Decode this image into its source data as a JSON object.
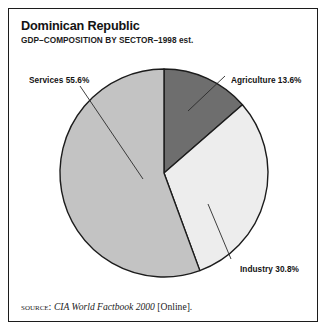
{
  "figure": {
    "title": "Dominican Republic",
    "subtitle": "GDP–COMPOSITION BY SECTOR–1998 est.",
    "source": {
      "label": "SOURCE:",
      "work": "CIA World Factbook 2000",
      "suffix": "[Online]."
    }
  },
  "labels": {
    "services": "Services 55.6%",
    "agriculture": "Agriculture 13.6%",
    "industry": "Industry 30.8%"
  },
  "chart_data": {
    "type": "pie",
    "title": "Dominican Republic",
    "subtitle": "GDP–COMPOSITION BY SECTOR–1998 est.",
    "unit": "percent of GDP",
    "categories": [
      "Agriculture",
      "Industry",
      "Services"
    ],
    "values": [
      13.6,
      30.8,
      55.6
    ],
    "labels": [
      "Agriculture 13.6%",
      "Industry 30.8%",
      "Services 55.6%"
    ],
    "colors": [
      "#6e6e6e",
      "#ededed",
      "#c3c3c3"
    ],
    "start_angle_deg": 0,
    "direction": "clockwise",
    "legend": "none",
    "grid": false,
    "annotations": [
      "SOURCE: CIA World Factbook 2000 [Online]."
    ]
  },
  "geometry": {
    "center_x": 163,
    "center_y": 172,
    "radius": 104
  },
  "colors": {
    "agriculture": "#6e6e6e",
    "industry": "#ededed",
    "services": "#c3c3c3",
    "outline": "#1c1c1c",
    "background": "#ffffff"
  }
}
